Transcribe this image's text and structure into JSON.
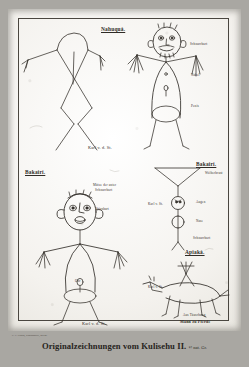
{
  "plate": {
    "caption_main": "Originalzeichnungen vom Kulisehu II.",
    "caption_scale": "½ nat. Gr.",
    "imprint": "C. F. Nissen, Kunstanstalt, Berlin.",
    "border_color": "#4a4640",
    "ink_color": "#2f2b26",
    "paper_color": "#f4f2ee"
  },
  "panels": {
    "top": {
      "tribe_label": "Nahuquá.",
      "signature": "Karl v. d. St.",
      "left_figure": {
        "name": "armed-standing-figure",
        "annotations": []
      },
      "right_figure": {
        "name": "figure-with-head-annotations",
        "annotations": [
          {
            "label": "Schnurrbart",
            "x": 190,
            "y": 43
          },
          {
            "label": "Nabel",
            "x": 191,
            "y": 74
          },
          {
            "label": "Penis",
            "x": 191,
            "y": 105
          }
        ]
      }
    },
    "middle_left": {
      "tribe_label": "Bakairí.",
      "signature": "Karl v. d. St.",
      "figure": {
        "name": "bakairi-large-figure",
        "annotations": [
          {
            "label": "Mütze der unter",
            "x": 93,
            "y": 184
          },
          {
            "label": "Schnurrbart",
            "x": 95,
            "y": 189
          },
          {
            "label": "Stirnbart",
            "x": 96,
            "y": 208
          },
          {
            "label": "Ohr",
            "x": 79,
            "y": 258
          }
        ]
      }
    },
    "middle_right": {
      "tribe_label": "Bakairí.",
      "signature_left": "Karl v. St.",
      "figure": {
        "name": "bakairi-stick-figure",
        "annotations": [
          {
            "label": "Weiberbrust",
            "x": 207,
            "y": 178
          },
          {
            "label": "Augen",
            "x": 206,
            "y": 206
          },
          {
            "label": "Nase",
            "x": 206,
            "y": 222
          },
          {
            "label": "Schnurrbart",
            "x": 206,
            "y": 236
          }
        ]
      }
    },
    "bottom_right": {
      "tribe_label": "Apiaká.",
      "signature_left": "Karl v. St.",
      "caption_line_1": "Aus Täuschung",
      "caption_line_2": "Mann zu Pferde",
      "figure": {
        "name": "man-on-horseback-figure"
      }
    }
  }
}
